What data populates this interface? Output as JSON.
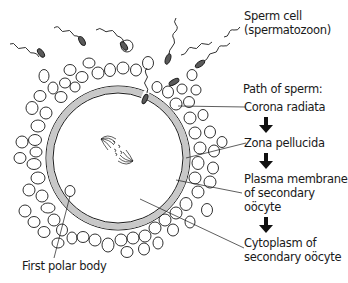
{
  "diagram": {
    "type": "biology-labeled-diagram",
    "labels": {
      "sperm_cell": "Sperm cell",
      "sperm_cell_alt": "(spermatozoon)",
      "path_heading": "Path of sperm:",
      "corona_radiata": "Corona radiata",
      "zona_pellucida": "Zona pellucida",
      "plasma_membrane_1": "Plasma membrane",
      "plasma_membrane_2": "of secondary",
      "plasma_membrane_3": "oöcyte",
      "cytoplasm_1": "Cytoplasm of",
      "cytoplasm_2": "secondary oöcyte",
      "first_polar_body": "First polar body"
    },
    "path_sequence": [
      "Corona radiata",
      "Zona pellucida",
      "Plasma membrane of secondary oöcyte",
      "Cytoplasm of secondary oöcyte"
    ],
    "colors": {
      "line": "#1a1a1a",
      "zona_fill": "#c8c8c8",
      "sperm_head": "#5a5a5a",
      "background": "#ffffff"
    }
  }
}
